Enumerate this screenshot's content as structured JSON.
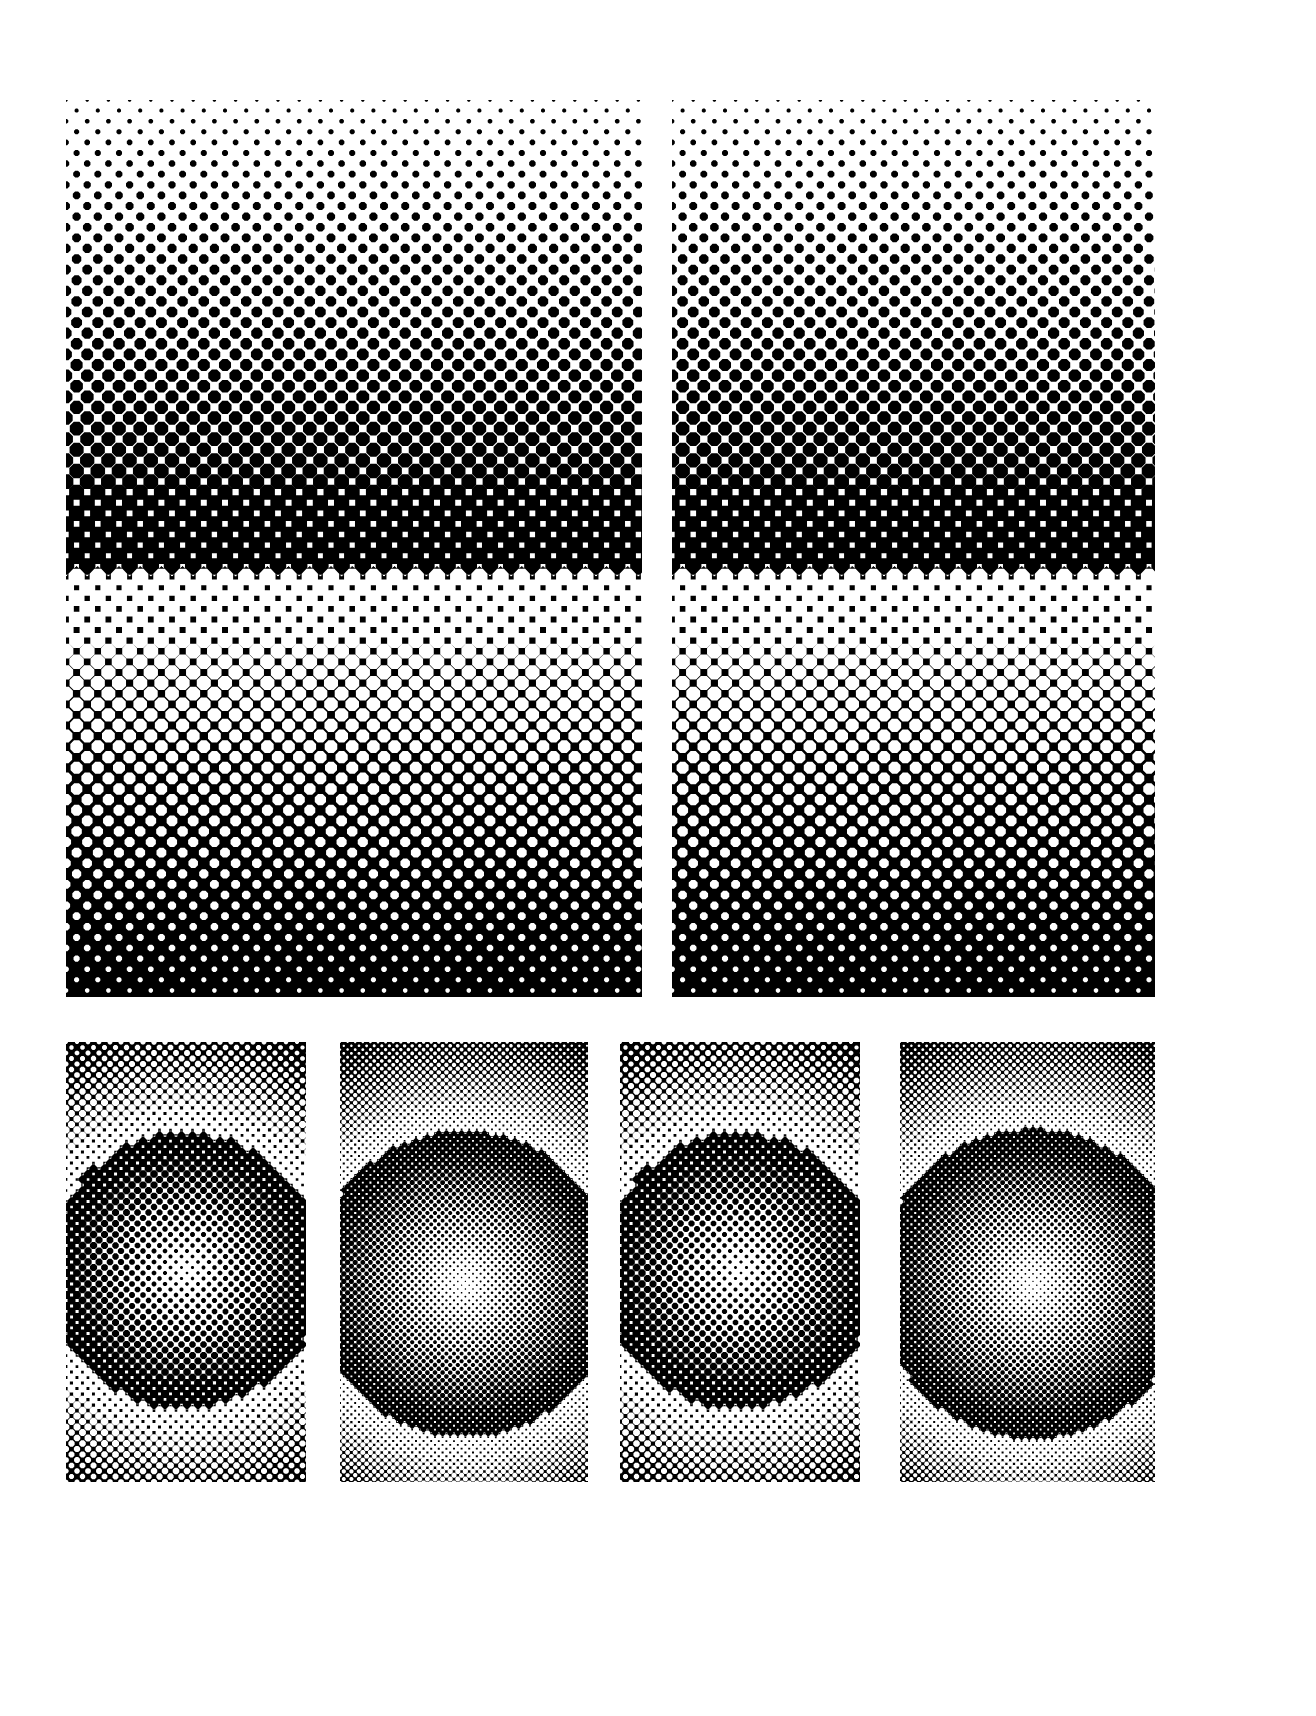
{
  "document": {
    "title": "Halftone Gradient Plate",
    "canvas_width": 1316,
    "canvas_height": 1716,
    "background_color": "#ffffff",
    "ink_color": "#000000",
    "paper_color": "#ffffff",
    "description": "Printed test plate of halftone screen gradients: two large vertical linear ramps on top, four smaller radial ramps below."
  },
  "chart_data": {
    "type": "heatmap",
    "title": "Halftone Gradient Plate",
    "subtitle": "Amplitude-modulated dot screen test chart",
    "xlabel": "",
    "ylabel": "",
    "grid": false,
    "legend": "none",
    "colormap": [
      "#ffffff",
      "#000000"
    ],
    "value_range": [
      0,
      1
    ],
    "value_meaning": "ink coverage fraction (0 = blank paper, 1 = solid ink)",
    "screen_angle_degrees": 45,
    "cell_shape": "octagon",
    "panels": [
      {
        "id": "panel-top-left",
        "row": "top",
        "index": 0,
        "gradient": "linear-vertical",
        "x": 66,
        "y": 100,
        "width": 576,
        "height": 897,
        "dot_pitch": 21.2,
        "coverage_top": 0.02,
        "coverage_bottom": 0.97,
        "crossover_y_fraction": 0.52,
        "stops": [
          {
            "position": 0.0,
            "coverage": 0.02
          },
          {
            "position": 0.25,
            "coverage": 0.22
          },
          {
            "position": 0.52,
            "coverage": 0.5
          },
          {
            "position": 0.75,
            "coverage": 0.74
          },
          {
            "position": 1.0,
            "coverage": 0.97
          }
        ]
      },
      {
        "id": "panel-top-right",
        "row": "top",
        "index": 1,
        "gradient": "linear-vertical",
        "x": 672,
        "y": 100,
        "width": 483,
        "height": 897,
        "dot_pitch": 21.2,
        "coverage_top": 0.02,
        "coverage_bottom": 0.97,
        "crossover_y_fraction": 0.52,
        "stops": [
          {
            "position": 0.0,
            "coverage": 0.02
          },
          {
            "position": 0.25,
            "coverage": 0.22
          },
          {
            "position": 0.52,
            "coverage": 0.5
          },
          {
            "position": 0.75,
            "coverage": 0.74
          },
          {
            "position": 1.0,
            "coverage": 0.97
          }
        ]
      },
      {
        "id": "panel-bottom-1",
        "row": "bottom",
        "index": 0,
        "gradient": "radial",
        "x": 66,
        "y": 1042,
        "width": 240,
        "height": 440,
        "dot_pitch": 11.0,
        "center_x_fraction": 0.5,
        "center_y_fraction": 0.52,
        "coverage_center": 0.04,
        "coverage_edge": 0.9,
        "falloff_exponent": 1.0
      },
      {
        "id": "panel-bottom-2",
        "row": "bottom",
        "index": 1,
        "gradient": "radial",
        "x": 340,
        "y": 1042,
        "width": 248,
        "height": 440,
        "dot_pitch": 7.6,
        "center_x_fraction": 0.5,
        "center_y_fraction": 0.55,
        "coverage_center": 0.02,
        "coverage_edge": 0.95,
        "falloff_exponent": 1.15
      },
      {
        "id": "panel-bottom-3",
        "row": "bottom",
        "index": 2,
        "gradient": "radial",
        "x": 620,
        "y": 1042,
        "width": 240,
        "height": 440,
        "dot_pitch": 11.0,
        "center_x_fraction": 0.5,
        "center_y_fraction": 0.52,
        "coverage_center": 0.04,
        "coverage_edge": 0.9,
        "falloff_exponent": 1.0
      },
      {
        "id": "panel-bottom-4",
        "row": "bottom",
        "index": 3,
        "gradient": "radial",
        "x": 900,
        "y": 1042,
        "width": 255,
        "height": 440,
        "dot_pitch": 7.6,
        "center_x_fraction": 0.52,
        "center_y_fraction": 0.55,
        "coverage_center": 0.02,
        "coverage_edge": 0.95,
        "falloff_exponent": 1.15
      }
    ]
  }
}
